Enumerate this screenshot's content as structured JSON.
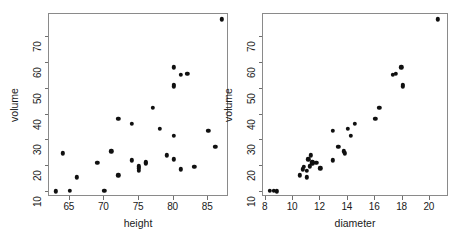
{
  "figure": {
    "background_color": "#ffffff",
    "point_color": "#101010",
    "frame_color": "#8a8a8a",
    "axis_color": "#6f6f6f",
    "text_color": "#1a1a1a"
  },
  "chart_data": [
    {
      "type": "scatter",
      "title": "",
      "xlabel": "height",
      "ylabel": "volume",
      "xlim": [
        62.0,
        88.0
      ],
      "ylim": [
        8.0,
        79.0
      ],
      "xticks": [
        65,
        70,
        75,
        80,
        85
      ],
      "yticks": [
        10,
        20,
        30,
        40,
        50,
        60,
        70
      ],
      "grid": false,
      "legend": "none",
      "x": [
        70,
        65,
        63,
        72,
        81,
        83,
        66,
        75,
        80,
        75,
        79,
        76,
        76,
        69,
        75,
        74,
        85,
        86,
        71,
        64,
        78,
        80,
        74,
        72,
        77,
        81,
        82,
        80,
        80,
        80,
        87
      ],
      "y": [
        10.3,
        10.3,
        10.2,
        16.4,
        18.8,
        19.7,
        15.6,
        18.2,
        22.6,
        19.9,
        24.2,
        21.0,
        21.4,
        21.3,
        19.1,
        22.2,
        33.8,
        27.4,
        25.7,
        24.9,
        34.5,
        31.7,
        36.3,
        38.3,
        42.6,
        55.4,
        55.7,
        58.3,
        51.5,
        51.0,
        77.0
      ]
    },
    {
      "type": "scatter",
      "title": "",
      "xlabel": "diameter",
      "ylabel": "volume",
      "xlim": [
        7.8,
        21.4
      ],
      "ylim": [
        8.0,
        79.0
      ],
      "xticks": [
        8,
        10,
        12,
        14,
        16,
        18,
        20
      ],
      "yticks": [
        10,
        20,
        30,
        40,
        50,
        60,
        70
      ],
      "grid": false,
      "legend": "none",
      "x": [
        8.3,
        8.6,
        8.8,
        10.5,
        10.7,
        10.8,
        11.0,
        11.0,
        11.1,
        11.2,
        11.3,
        11.4,
        11.4,
        11.7,
        12.0,
        12.9,
        12.9,
        13.3,
        13.7,
        13.8,
        14.0,
        14.2,
        14.5,
        16.0,
        16.3,
        17.3,
        17.5,
        17.9,
        18.0,
        18.0,
        20.6
      ],
      "y": [
        10.3,
        10.3,
        10.2,
        16.4,
        18.8,
        19.7,
        15.6,
        18.2,
        22.6,
        19.9,
        24.2,
        21.0,
        21.4,
        21.3,
        19.1,
        22.2,
        33.8,
        27.4,
        25.7,
        24.9,
        34.5,
        31.7,
        36.3,
        38.3,
        42.6,
        55.4,
        55.7,
        58.3,
        51.5,
        51.0,
        77.0
      ]
    }
  ]
}
